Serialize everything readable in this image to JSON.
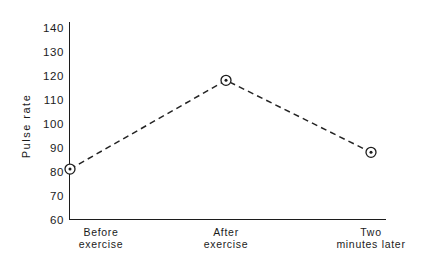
{
  "chart_data": {
    "type": "line",
    "title": "",
    "subtitle": "",
    "xlabel": "",
    "ylabel": "Pulse rate",
    "categories": [
      "Before exercise",
      "After exercise",
      "Two minutes later"
    ],
    "category_lines": [
      [
        "Before",
        "exercise"
      ],
      [
        "After",
        "exercise"
      ],
      [
        "Two",
        "minutes later"
      ]
    ],
    "values": [
      81,
      118,
      88
    ],
    "ylim": [
      60,
      140
    ],
    "yticks": [
      60,
      70,
      80,
      90,
      100,
      110,
      120,
      130,
      140
    ],
    "ytick_labels": [
      "60",
      "70",
      "80",
      "90",
      "100",
      "110",
      "120",
      "130",
      "140"
    ],
    "grid": false,
    "legend": false,
    "legend_position": "none",
    "line_style": "dashed",
    "marker": "circle-with-center-dot",
    "series": [
      {
        "name": "Pulse rate",
        "values": [
          81,
          118,
          88
        ]
      }
    ],
    "colors": {
      "line": "#242424",
      "marker": "#1c1c1c",
      "axis": "#1c1c1c",
      "text": "#1b1b1b",
      "background": "#ffffff"
    }
  }
}
